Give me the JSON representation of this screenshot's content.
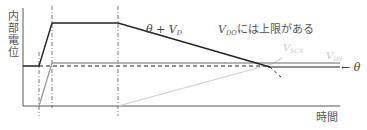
{
  "diagram": {
    "y_axis_label": "内部電位",
    "x_axis_label": "時間",
    "labels": {
      "theta_plus_vd": {
        "main": "θ + V",
        "sub": "D"
      },
      "vdo_note": {
        "main": "V",
        "sub": "DO",
        "rest": "には上限がある"
      },
      "vscx": {
        "main": "V",
        "sub": "SCX"
      },
      "vds": {
        "main": "V",
        "sub": "DS"
      },
      "theta_arrow": "← θ"
    },
    "colors": {
      "axis": "#555555",
      "theta_plus_vd_line": "#222222",
      "vds_line": "#9a9a9a",
      "vscx_line": "#cfcfcf",
      "guide_lines": "#555555"
    }
  }
}
